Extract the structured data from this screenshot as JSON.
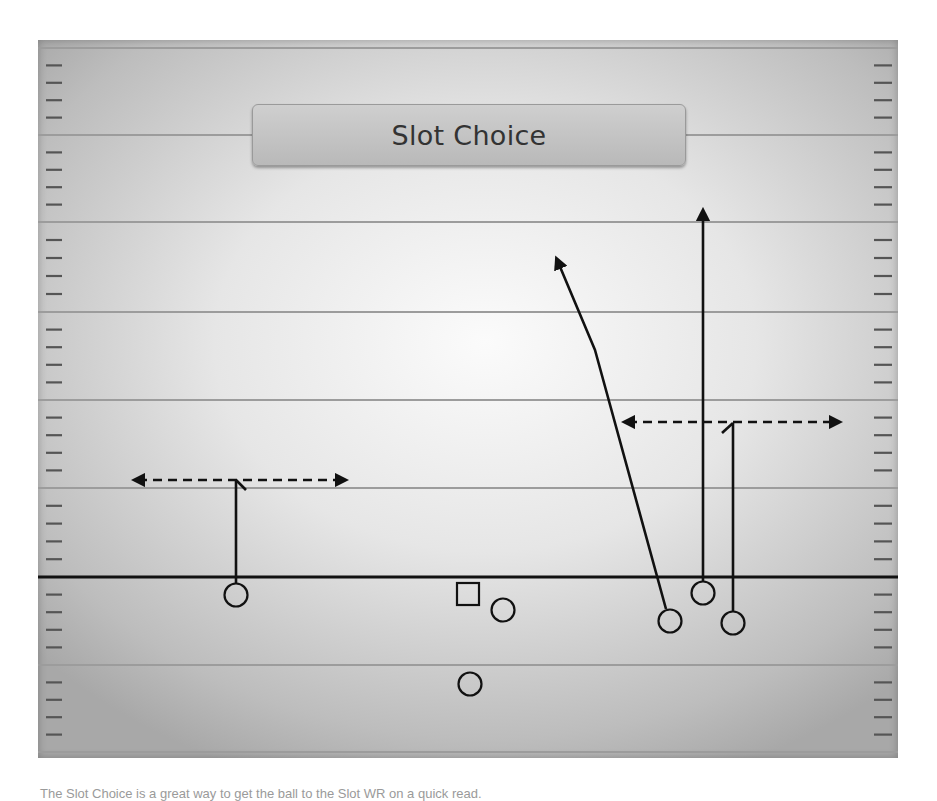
{
  "title": "Slot Choice",
  "caption": "The Slot Choice is a great way to get the ball to the Slot WR on a quick read.",
  "colors": {
    "field_center": "#fbfbfb",
    "field_edge": "#a8a8a8",
    "yard_line": "#9c9c9c",
    "line_of_scrimmage": "#111111",
    "route": "#111111",
    "title_box": "#c4c4c4",
    "title_text": "#333333"
  },
  "field": {
    "yard_lines_y": [
      48,
      135,
      222,
      312,
      400,
      488,
      665,
      752
    ],
    "line_of_scrimmage_y": 577,
    "hash_marks_left_x": [
      46,
      62
    ],
    "hash_marks_right_x": [
      874,
      892
    ]
  },
  "players": [
    {
      "id": "wr-left",
      "shape": "circle",
      "x": 236,
      "y": 595,
      "label": "Left WR"
    },
    {
      "id": "center",
      "shape": "square",
      "x": 468,
      "y": 594,
      "label": "Center"
    },
    {
      "id": "qb-adjacent",
      "shape": "circle",
      "x": 503,
      "y": 610,
      "label": "Lineman/Back"
    },
    {
      "id": "rb",
      "shape": "circle",
      "x": 470,
      "y": 684,
      "label": "Running Back"
    },
    {
      "id": "slot-inside",
      "shape": "circle",
      "x": 670,
      "y": 621,
      "label": "Inside Slot"
    },
    {
      "id": "slot-wr",
      "shape": "circle",
      "x": 703,
      "y": 593,
      "label": "Slot WR"
    },
    {
      "id": "wr-right",
      "shape": "circle",
      "x": 733,
      "y": 623,
      "label": "Right WR"
    }
  ],
  "routes": [
    {
      "id": "left-stem",
      "type": "solid",
      "points": [
        [
          236,
          583
        ],
        [
          236,
          480
        ]
      ],
      "arrow": false
    },
    {
      "id": "left-choice",
      "type": "dashed",
      "points": [
        [
          138,
          480
        ],
        [
          342,
          480
        ]
      ],
      "arrow": "both"
    },
    {
      "id": "inside-seam",
      "type": "solid",
      "points": [
        [
          666,
          609
        ],
        [
          595,
          350
        ],
        [
          558,
          262
        ]
      ],
      "arrow": "end"
    },
    {
      "id": "slot-go",
      "type": "solid",
      "points": [
        [
          703,
          581
        ],
        [
          703,
          214
        ]
      ],
      "arrow": "end"
    },
    {
      "id": "right-stem",
      "type": "solid",
      "points": [
        [
          733,
          611
        ],
        [
          733,
          423
        ]
      ],
      "arrow": false
    },
    {
      "id": "right-choice",
      "type": "dashed",
      "points": [
        [
          628,
          422
        ],
        [
          836,
          422
        ]
      ],
      "arrow": "both"
    }
  ]
}
